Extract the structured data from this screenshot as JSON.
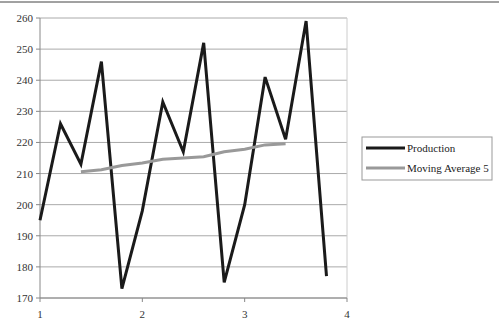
{
  "chart_data": {
    "type": "line",
    "title": "",
    "xlabel": "",
    "ylabel": "",
    "xlim": [
      1,
      4
    ],
    "ylim": [
      170,
      260
    ],
    "x_ticks": [
      "1",
      "2",
      "3",
      "4"
    ],
    "y_ticks": [
      "170",
      "180",
      "190",
      "200",
      "210",
      "220",
      "230",
      "240",
      "250",
      "260"
    ],
    "grid": "horizontal",
    "legend_position": "right",
    "series": [
      {
        "name": "Production",
        "color": "#1a1a1a",
        "x": [
          1.0,
          1.2,
          1.4,
          1.6,
          1.8,
          2.0,
          2.2,
          2.4,
          2.6,
          2.8,
          3.0,
          3.2,
          3.4,
          3.6,
          3.8
        ],
        "values": [
          195,
          226,
          213,
          246,
          173,
          198,
          233,
          217,
          252,
          175,
          200,
          241,
          221,
          259,
          177
        ]
      },
      {
        "name": "Moving Average 5",
        "color": "#999999",
        "x": [
          1.4,
          1.6,
          1.8,
          2.0,
          2.2,
          2.4,
          2.6,
          2.8,
          3.0,
          3.2,
          3.4
        ],
        "values": [
          210.6,
          211.2,
          212.6,
          213.4,
          214.6,
          215.0,
          215.4,
          217.0,
          217.8,
          219.2,
          219.6
        ]
      }
    ]
  }
}
